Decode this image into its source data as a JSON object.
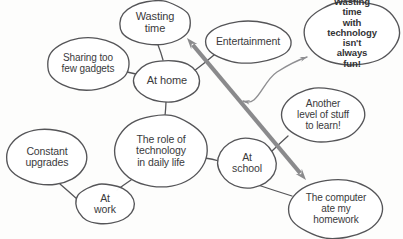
{
  "diagram": {
    "style": {
      "background": "#fdfdfc",
      "ellipse_stroke": "#555558",
      "text_color": "#3a3a3c",
      "thick_arrow_color": "#8a8a8c",
      "thin_arrow_color": "#8f8f92"
    },
    "nodes": [
      {
        "id": "wasting-time",
        "label": "Wasting\ntime",
        "cx": 155,
        "cy": 23,
        "rx": 36,
        "ry": 22,
        "font_size": 11,
        "bold": false
      },
      {
        "id": "entertainment",
        "label": "Entertainment",
        "cx": 248,
        "cy": 42,
        "rx": 43,
        "ry": 21,
        "font_size": 10.5,
        "bold": false
      },
      {
        "id": "wasting-time-with-technology",
        "label": "Wasting time\nwith technology\nisn't always\nfun!",
        "cx": 352,
        "cy": 33,
        "rx": 48,
        "ry": 32,
        "font_size": 9.5,
        "bold": true
      },
      {
        "id": "sharing-too-few-gadgets",
        "label": "Sharing too\nfew gadgets",
        "cx": 88,
        "cy": 64,
        "rx": 41,
        "ry": 26,
        "font_size": 10,
        "bold": false
      },
      {
        "id": "at-home",
        "label": "At home",
        "cx": 167,
        "cy": 81,
        "rx": 33,
        "ry": 21,
        "font_size": 11,
        "bold": false
      },
      {
        "id": "another-level-of-stuff",
        "label": "Another\nlevel of stuff\nto learn!",
        "cx": 323,
        "cy": 115,
        "rx": 41,
        "ry": 27,
        "font_size": 10,
        "bold": false
      },
      {
        "id": "role-of-technology",
        "label": "The role of\ntechnology\nin daily life",
        "cx": 161,
        "cy": 151,
        "rx": 46,
        "ry": 36,
        "font_size": 10.5,
        "bold": false
      },
      {
        "id": "constant-upgrades",
        "label": "Constant\nupgrades",
        "cx": 47,
        "cy": 157,
        "rx": 40,
        "ry": 28,
        "font_size": 10.5,
        "bold": false
      },
      {
        "id": "at-school",
        "label": "At\nschool",
        "cx": 247,
        "cy": 163,
        "rx": 29,
        "ry": 25,
        "font_size": 10.5,
        "bold": false
      },
      {
        "id": "at-work",
        "label": "At\nwork",
        "cx": 105,
        "cy": 204,
        "rx": 29,
        "ry": 20,
        "font_size": 10.5,
        "bold": false
      },
      {
        "id": "computer-ate-my-homework",
        "label": "The computer\nate my\nhomework",
        "cx": 336,
        "cy": 209,
        "rx": 47,
        "ry": 29,
        "font_size": 10,
        "bold": false
      }
    ],
    "connectors": [
      {
        "id": "athome-wastingtime",
        "from": "at-home",
        "to": "wasting-time",
        "x1": 163,
        "y1": 60,
        "x2": 158,
        "y2": 45
      },
      {
        "id": "athome-sharinggadgets",
        "from": "at-home",
        "to": "sharing-too-few-gadgets",
        "x1": 136,
        "y1": 74,
        "x2": 123,
        "y2": 71
      },
      {
        "id": "athome-entertainment",
        "from": "at-home",
        "to": "entertainment",
        "x1": 194,
        "y1": 71,
        "x2": 214,
        "y2": 55
      },
      {
        "id": "athome-role",
        "from": "at-home",
        "to": "role-of-technology",
        "x1": 166,
        "y1": 102,
        "x2": 165,
        "y2": 116
      },
      {
        "id": "role-atwork",
        "from": "role-of-technology",
        "to": "at-work",
        "x1": 131,
        "y1": 180,
        "x2": 117,
        "y2": 190
      },
      {
        "id": "role-atschool",
        "from": "role-of-technology",
        "to": "at-school",
        "x1": 205,
        "y1": 158,
        "x2": 219,
        "y2": 161
      },
      {
        "id": "atwork-constantupgrades",
        "from": "at-work",
        "to": "constant-upgrades",
        "x1": 77,
        "y1": 199,
        "x2": 60,
        "y2": 184
      },
      {
        "id": "atschool-anotherlevel",
        "from": "at-school",
        "to": "another-level-of-stuff",
        "x1": 272,
        "y1": 151,
        "x2": 288,
        "y2": 136
      },
      {
        "id": "atschool-homework",
        "from": "at-school",
        "to": "computer-ate-my-homework",
        "x1": 258,
        "y1": 185,
        "x2": 292,
        "y2": 196
      }
    ],
    "arrows": [
      {
        "id": "thick-double-arrow",
        "kind": "double-headed-straight",
        "description": "thick double-headed arrow from At home / Wasting time area down to The computer ate my homework",
        "x1": 187,
        "y1": 38,
        "x2": 306,
        "y2": 180,
        "color": "#8a8a8c",
        "width": 4
      },
      {
        "id": "thin-curved-double-arrow",
        "kind": "double-headed-curve",
        "description": "thin curved double-headed arrow between Wasting time with technology and Another level of stuff",
        "path": "M 243 101 C 258 108 262 82 277 72 C 288 65 298 60 307 57",
        "color": "#8f8f92",
        "width": 1.4
      }
    ]
  }
}
